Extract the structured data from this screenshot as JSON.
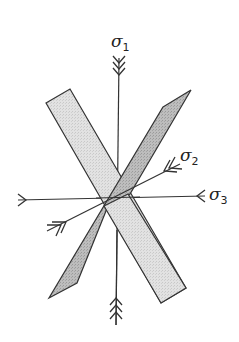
{
  "diagram": {
    "colors": {
      "line": "#333333",
      "light_band_fill": "#dcdcdc",
      "dark_band_fill": "#b4b4b4",
      "background": "#ffffff"
    },
    "labels": {
      "sigma1": {
        "symbol": "σ",
        "subscript": "1"
      },
      "sigma2": {
        "symbol": "σ",
        "subscript": "2"
      },
      "sigma3": {
        "symbol": "σ",
        "subscript": "3"
      }
    },
    "axes": [
      {
        "name": "sigma1",
        "arrowheads": 3,
        "direction": "vertical"
      },
      {
        "name": "sigma2",
        "arrowheads": 2,
        "direction": "oblique"
      },
      {
        "name": "sigma3",
        "arrowheads": 1,
        "direction": "horizontal"
      }
    ],
    "planes": [
      {
        "name": "light-fracture-plane",
        "orientation": "upper-left to lower-right"
      },
      {
        "name": "dark-fracture-plane",
        "orientation": "lower-left to upper-right"
      }
    ]
  }
}
